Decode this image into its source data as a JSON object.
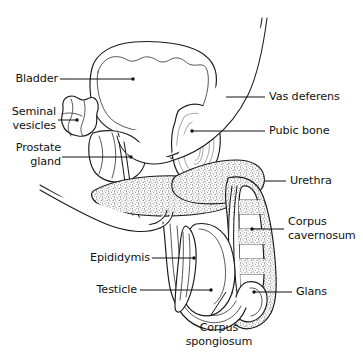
{
  "diagram": {
    "background_color": "#ffffff",
    "line_color": "#1a1a1a",
    "stipple_color": "#7d7d7d",
    "labels": [
      {
        "id": "bladder",
        "text": "Bladder",
        "side": "left"
      },
      {
        "id": "seminal-vesicles-1",
        "text": "Seminal",
        "side": "left"
      },
      {
        "id": "seminal-vesicles-2",
        "text": "vesicles",
        "side": "left"
      },
      {
        "id": "prostate-gland-1",
        "text": "Prostate",
        "side": "left"
      },
      {
        "id": "prostate-gland-2",
        "text": "gland",
        "side": "left"
      },
      {
        "id": "epididymis",
        "text": "Epididymis",
        "side": "left"
      },
      {
        "id": "testicle",
        "text": "Testicle",
        "side": "left"
      },
      {
        "id": "vas-deferens",
        "text": "Vas deferens",
        "side": "right"
      },
      {
        "id": "pubic-bone",
        "text": "Pubic bone",
        "side": "right"
      },
      {
        "id": "urethra",
        "text": "Urethra",
        "side": "right"
      },
      {
        "id": "corpus-cavernosum-1",
        "text": "Corpus",
        "side": "right"
      },
      {
        "id": "corpus-cavernosum-2",
        "text": "cavernosum",
        "side": "right"
      },
      {
        "id": "glans",
        "text": "Glans",
        "side": "right"
      },
      {
        "id": "corpus-spongiosum-1",
        "text": "Corpus",
        "side": "center"
      },
      {
        "id": "corpus-spongiosum-2",
        "text": "spongiosum",
        "side": "center"
      }
    ]
  }
}
